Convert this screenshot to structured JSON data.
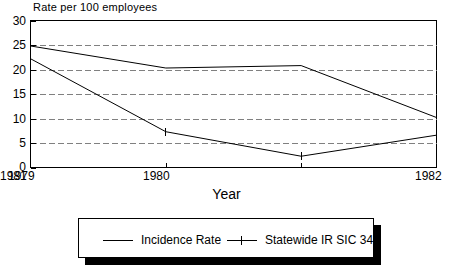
{
  "chart_data": {
    "type": "line",
    "title": "",
    "ylabel": "Rate per 100 employees",
    "xlabel": "Year",
    "categories": [
      "1979",
      "1980",
      "1981",
      "1982"
    ],
    "x": [
      1979,
      1980,
      1981,
      1982
    ],
    "xlim": [
      1979,
      1982
    ],
    "ylim": [
      0,
      30
    ],
    "yticks": [
      "0",
      "5",
      "10",
      "15",
      "20",
      "25",
      "30"
    ],
    "ytick_values": [
      0,
      5,
      10,
      15,
      20,
      25,
      30
    ],
    "grid": "horizontal-dashed",
    "legend_position": "bottom-center",
    "series": [
      {
        "name": "Incidence Rate",
        "marker": "none",
        "values": [
          24.8,
          20.3,
          20.8,
          10.2
        ]
      },
      {
        "name": "Statewide IR SIC 34",
        "marker": "tick",
        "values": [
          22.2,
          7.3,
          2.3,
          6.6
        ]
      }
    ],
    "colors": {
      "line": "#000000",
      "grid": "#808080",
      "axis": "#000000",
      "background": "#ffffff",
      "legend_shadow": "#000000"
    }
  },
  "legend": {
    "items": [
      {
        "label": "Incidence Rate"
      },
      {
        "label": "Statewide IR SIC 34"
      }
    ]
  }
}
